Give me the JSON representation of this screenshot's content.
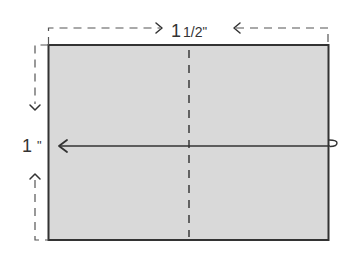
{
  "diagram": {
    "width_label": {
      "whole": "1",
      "fraction": "1/2",
      "unit": "\""
    },
    "height_label": {
      "whole": "1",
      "unit": "\""
    },
    "colors": {
      "fill": "#d9d9d9",
      "stroke": "#333333",
      "dash": "#555555",
      "background": "#ffffff"
    },
    "elements": [
      "rectangle-card",
      "vertical-center-fold-line",
      "horizontal-fold-arrow",
      "width-dimension",
      "height-dimension"
    ]
  }
}
